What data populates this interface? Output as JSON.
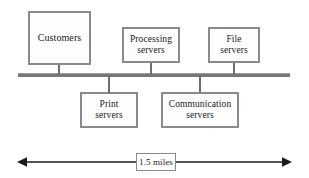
{
  "diagram": {
    "type": "network-bus-topology",
    "canvas": {
      "width": 309,
      "height": 178,
      "background": "#ffffff"
    },
    "style": {
      "box_border_color": "#8a8a8a",
      "box_fill_color": "#fdfdfd",
      "bus_color": "#777777",
      "connector_color": "#6f6f6f",
      "text_color": "#1a1a1a"
    },
    "bus": {
      "name": "shared-bus-backbone",
      "orientation": "horizontal"
    },
    "nodes": [
      {
        "id": "customers",
        "label": "Customers",
        "position": "above-bus"
      },
      {
        "id": "processing",
        "label": "Processing\nservers",
        "position": "above-bus"
      },
      {
        "id": "file",
        "label": "File\nservers",
        "position": "above-bus"
      },
      {
        "id": "print",
        "label": "Print\nservers",
        "position": "below-bus"
      },
      {
        "id": "communication",
        "label": "Communication\nservers",
        "position": "below-bus"
      }
    ],
    "dimension": {
      "label": "1.5 miles",
      "arrow_style": "double-headed",
      "spans": "entire-bus-length"
    }
  }
}
